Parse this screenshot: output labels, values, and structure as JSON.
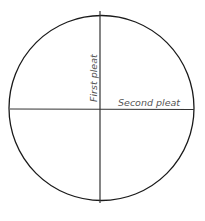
{
  "diagram": {
    "labels": {
      "first_pleat": "First pleat",
      "second_pleat": "Second pleat"
    },
    "colors": {
      "stroke": "#1a1a1a",
      "label": "#555555"
    }
  }
}
